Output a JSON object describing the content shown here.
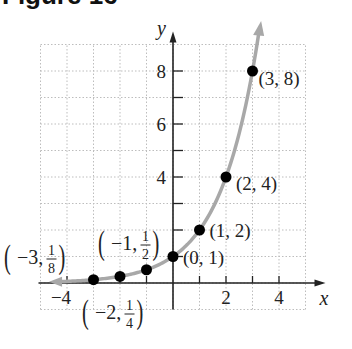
{
  "figure": {
    "title": "Figure 16"
  },
  "chart_data": {
    "type": "scatter",
    "function": "y = 2^x",
    "title": "",
    "xlabel": "x",
    "ylabel": "y",
    "xlim": [
      -5,
      5
    ],
    "ylim": [
      -1,
      9
    ],
    "grid": true,
    "x_ticks": [
      -4,
      -3,
      -2,
      -1,
      1,
      2,
      3,
      4
    ],
    "x_tick_labels": [
      {
        "value": -4,
        "label": "−4"
      },
      {
        "value": 2,
        "label": "2"
      },
      {
        "value": 4,
        "label": "4"
      }
    ],
    "y_ticks": [
      1,
      2,
      3,
      4,
      5,
      6,
      7,
      8
    ],
    "y_tick_labels": [
      {
        "value": 4,
        "label": "4"
      },
      {
        "value": 6,
        "label": "6"
      },
      {
        "value": 8,
        "label": "8"
      }
    ],
    "points": [
      {
        "x": -3,
        "y": 0.125,
        "label_pre": "−3,",
        "num": "1",
        "den": "8",
        "frac": true
      },
      {
        "x": -2,
        "y": 0.25,
        "label_pre": "−2,",
        "num": "1",
        "den": "4",
        "frac": true
      },
      {
        "x": -1,
        "y": 0.5,
        "label_pre": "−1,",
        "num": "1",
        "den": "2",
        "frac": true
      },
      {
        "x": 0,
        "y": 1,
        "label": "(0, 1)"
      },
      {
        "x": 1,
        "y": 2,
        "label": "(1, 2)"
      },
      {
        "x": 2,
        "y": 4,
        "label": "(2, 4)"
      },
      {
        "x": 3,
        "y": 8,
        "label": "(3, 8)"
      }
    ],
    "curve_color": "#a8a8a8",
    "point_color": "#000000"
  }
}
